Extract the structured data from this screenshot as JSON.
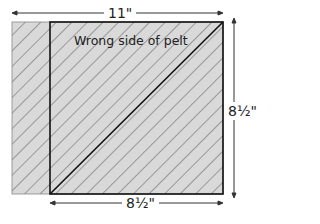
{
  "diagram": {
    "title_label": "Wrong side of pelt",
    "width_label": "11\"",
    "square_width_label": "8½\"",
    "height_label": "8½\"",
    "footer_partial": "",
    "colors": {
      "fill": "#d9d9d9",
      "hatch": "#555555",
      "outline": "#111111",
      "text": "#222222"
    }
  }
}
